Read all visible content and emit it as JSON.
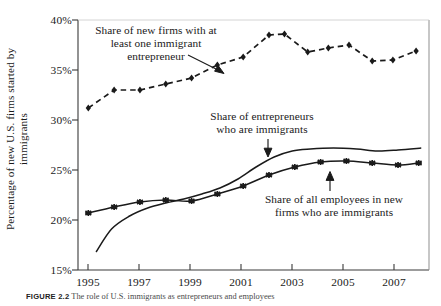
{
  "figure": {
    "caption_tag": "FIGURE 2.2",
    "caption_text": "The role of U.S. immigrants as entrepreneurs and employees"
  },
  "chart_data": {
    "type": "line",
    "title": "",
    "xlabel": "",
    "ylabel": "Percentage of new U.S. firms started by immigrants",
    "ylabel_line1": "Percentage of new U.S. firms started by",
    "ylabel_line2": "immigrants",
    "xlim": [
      1995,
      2008.6
    ],
    "ylim": [
      15,
      40
    ],
    "ytick_labels": [
      "40%",
      "35%",
      "30%",
      "25%",
      "20%",
      "15%"
    ],
    "ytick_values": [
      40,
      35,
      30,
      25,
      20,
      15
    ],
    "xtick_labels": [
      "1995",
      "1997",
      "1999",
      "2001",
      "2003",
      "2005",
      "2007"
    ],
    "xtick_values": [
      1995,
      1997,
      1999,
      2001,
      2003,
      2005,
      2007
    ],
    "grid": false,
    "legend": "none (inline annotations)",
    "series": [
      {
        "name": "Share of new firms with at least one immigrant entrepreneur",
        "style": "dashed",
        "marker": "diamond",
        "color": "#1a1a1a",
        "x": [
          1995.4,
          1996.4,
          1997.4,
          1998.4,
          1999.4,
          2000.4,
          2001.4,
          2002.4,
          2003.0,
          2003.9,
          2004.7,
          2005.5,
          2006.4,
          2007.2,
          2008.1
        ],
        "values": [
          31.2,
          33.0,
          33.0,
          33.6,
          34.2,
          35.5,
          36.3,
          38.5,
          38.6,
          36.8,
          37.2,
          37.5,
          35.9,
          36.0,
          36.9
        ]
      },
      {
        "name": "Share of entrepreneurs who are immigrants",
        "style": "solid",
        "marker": "none",
        "color": "#1a1a1a",
        "x": [
          1995.7,
          1996.3,
          1997.0,
          1997.7,
          1998.4,
          1999.1,
          1999.8,
          2000.5,
          2001.2,
          2001.9,
          2002.6,
          2003.3,
          2004.0,
          2004.9,
          2005.8,
          2006.6,
          2007.4,
          2008.3
        ],
        "values": [
          16.8,
          19.1,
          20.4,
          21.2,
          21.7,
          22.1,
          22.6,
          23.2,
          24.1,
          25.3,
          26.3,
          26.9,
          27.1,
          27.2,
          27.1,
          26.9,
          27.0,
          27.2
        ]
      },
      {
        "name": "Share of all employees in new firms who are immigrants",
        "style": "solid",
        "marker": "star",
        "color": "#1a1a1a",
        "x": [
          1995.4,
          1996.4,
          1997.4,
          1998.4,
          1999.4,
          2000.4,
          2001.4,
          2002.4,
          2003.4,
          2004.4,
          2005.4,
          2006.4,
          2007.4,
          2008.2
        ],
        "values": [
          20.7,
          21.3,
          21.8,
          22.0,
          21.9,
          22.6,
          23.4,
          24.5,
          25.3,
          25.8,
          25.9,
          25.7,
          25.5,
          25.7
        ]
      }
    ],
    "annotations": [
      {
        "id": "top",
        "lines": [
          "Share of new firms with at",
          "least one immigrant",
          "entrepreneur"
        ],
        "target_series": "Share of new firms with at least one immigrant entrepreneur"
      },
      {
        "id": "middle",
        "lines": [
          "Share of entrepreneurs",
          "who are immigrants"
        ],
        "target_series": "Share of entrepreneurs who are immigrants"
      },
      {
        "id": "bottom",
        "lines": [
          "Share of all employees in new",
          "firms who are immigrants"
        ],
        "target_series": "Share of all employees in new firms who are immigrants"
      }
    ]
  }
}
